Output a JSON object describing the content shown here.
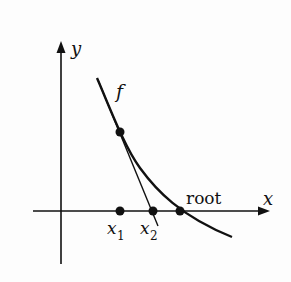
{
  "diagram": {
    "axes": {
      "x_label": "x",
      "y_label": "y"
    },
    "curve_label": "f",
    "points": {
      "x1_label": "x",
      "x1_sub": "1",
      "x2_label": "x",
      "x2_sub": "2",
      "root_label": "root"
    },
    "colors": {
      "ink": "#111111",
      "background": "#fdfdfd"
    }
  }
}
